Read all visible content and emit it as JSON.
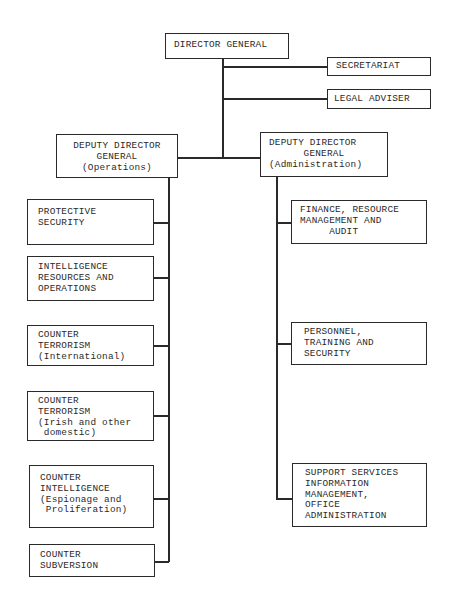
{
  "chart": {
    "top": {
      "director_general": {
        "lines": [
          "DIRECTOR GENERAL"
        ]
      },
      "secretariat": {
        "lines": [
          "SECRETARIAT"
        ]
      },
      "legal_adviser": {
        "lines": [
          "LEGAL ADVISER"
        ]
      }
    },
    "deputy_operations": {
      "lines": [
        "DEPUTY DIRECTOR",
        "GENERAL",
        "(Operations)"
      ]
    },
    "deputy_administration": {
      "lines": [
        "DEPUTY DIRECTOR",
        "GENERAL",
        "(Administration)"
      ]
    },
    "operations_units": [
      {
        "lines": [
          "PROTECTIVE",
          "SECURITY"
        ]
      },
      {
        "lines": [
          "INTELLIGENCE",
          "RESOURCES AND",
          "OPERATIONS"
        ]
      },
      {
        "lines": [
          "COUNTER",
          "TERRORISM",
          "(International)"
        ]
      },
      {
        "lines": [
          "COUNTER",
          "TERRORISM",
          "(Irish and other",
          " domestic)"
        ]
      },
      {
        "lines": [
          "COUNTER",
          "INTELLIGENCE",
          "(Espionage and",
          " Proliferation)"
        ]
      },
      {
        "lines": [
          "COUNTER",
          "SUBVERSION"
        ]
      }
    ],
    "administration_units": [
      {
        "lines": [
          "FINANCE, RESOURCE",
          "MANAGEMENT AND",
          "     AUDIT"
        ]
      },
      {
        "lines": [
          "PERSONNEL,",
          "TRAINING AND",
          "SECURITY"
        ]
      },
      {
        "lines": [
          "SUPPORT SERVICES",
          "INFORMATION",
          "MANAGEMENT,",
          "OFFICE",
          "ADMINISTRATION"
        ]
      }
    ]
  }
}
